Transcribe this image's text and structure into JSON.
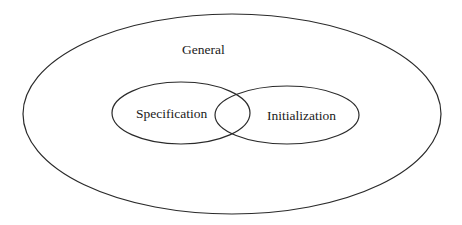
{
  "diagram": {
    "type": "venn",
    "sets": [
      {
        "id": "general",
        "label": "General",
        "contains": [
          "specification",
          "initialization"
        ]
      },
      {
        "id": "specification",
        "label": "Specification",
        "overlaps": [
          "initialization"
        ]
      },
      {
        "id": "initialization",
        "label": "Initialization",
        "overlaps": [
          "specification"
        ]
      }
    ],
    "stroke_color": "#2a2a2a",
    "background": "#ffffff"
  },
  "labels": {
    "general": "General",
    "specification": "Specification",
    "initialization": "Initialization"
  }
}
